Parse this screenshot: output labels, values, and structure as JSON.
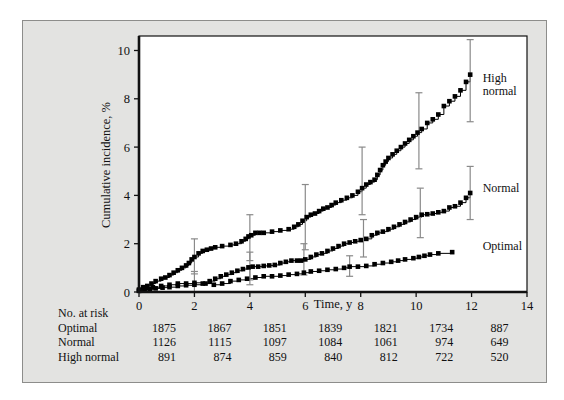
{
  "figure": {
    "background_color": "#e3e3e1",
    "plot_background_color": "#ffffff",
    "border_color": "#8d8d8b",
    "axis_color": "#111111",
    "marker_color": "#000000",
    "errorbar_color": "#8a8a8a"
  },
  "chart_data": {
    "type": "line",
    "title": "",
    "subtitle": "",
    "xlabel": "Time, y",
    "ylabel": "Cumulative incidence, %",
    "xlim": [
      0,
      14
    ],
    "ylim": [
      0,
      10.6
    ],
    "xticks": [
      0,
      2,
      4,
      6,
      8,
      10,
      12,
      14
    ],
    "xtick_labels": [
      "0",
      "2",
      "4",
      "6",
      "8",
      "10",
      "12",
      "14"
    ],
    "yticks": [
      0,
      2,
      4,
      6,
      8,
      10
    ],
    "ytick_labels": [
      "0",
      "2",
      "4",
      "6",
      "8",
      "10"
    ],
    "grid": false,
    "legend_position": "right-inline",
    "series": [
      {
        "name": "High normal",
        "label_lines": [
          "High",
          "normal"
        ],
        "label_x": 12.4,
        "label_y": 8.7,
        "marker": "square",
        "x": [
          0.0,
          0.15,
          0.3,
          0.45,
          0.6,
          0.8,
          0.95,
          1.1,
          1.25,
          1.4,
          1.55,
          1.7,
          1.8,
          1.9,
          2.0,
          2.15,
          2.3,
          2.45,
          2.6,
          2.75,
          3.0,
          3.3,
          3.5,
          3.7,
          3.85,
          3.95,
          4.05,
          4.2,
          4.35,
          4.5,
          4.8,
          5.1,
          5.4,
          5.6,
          5.75,
          5.9,
          6.05,
          6.2,
          6.35,
          6.5,
          6.65,
          6.8,
          6.95,
          7.1,
          7.3,
          7.5,
          7.7,
          7.9,
          8.05,
          8.2,
          8.35,
          8.5,
          8.6,
          8.7,
          8.8,
          8.9,
          9.0,
          9.15,
          9.3,
          9.45,
          9.6,
          9.75,
          9.9,
          10.05,
          10.2,
          10.4,
          10.6,
          10.8,
          11.0,
          11.2,
          11.4,
          11.6,
          11.8,
          11.95
        ],
        "y": [
          0.1,
          0.2,
          0.25,
          0.35,
          0.45,
          0.55,
          0.6,
          0.7,
          0.8,
          0.9,
          1.0,
          1.1,
          1.2,
          1.35,
          1.45,
          1.6,
          1.7,
          1.75,
          1.8,
          1.85,
          1.9,
          1.95,
          2.0,
          2.1,
          2.2,
          2.3,
          2.35,
          2.45,
          2.45,
          2.45,
          2.5,
          2.55,
          2.6,
          2.7,
          2.8,
          2.95,
          3.1,
          3.2,
          3.25,
          3.35,
          3.45,
          3.5,
          3.6,
          3.7,
          3.8,
          3.9,
          4.0,
          4.15,
          4.3,
          4.45,
          4.55,
          4.65,
          4.85,
          5.05,
          5.25,
          5.4,
          5.55,
          5.7,
          5.85,
          6.0,
          6.15,
          6.3,
          6.45,
          6.6,
          6.75,
          7.0,
          7.15,
          7.35,
          7.7,
          7.9,
          8.1,
          8.35,
          8.7,
          9.0
        ]
      },
      {
        "name": "Normal",
        "label_lines": [
          "Normal"
        ],
        "label_x": 12.4,
        "label_y": 4.15,
        "marker": "square",
        "x": [
          0.0,
          0.2,
          0.4,
          0.6,
          0.85,
          1.1,
          1.4,
          1.7,
          2.0,
          2.3,
          2.55,
          2.75,
          2.95,
          3.15,
          3.35,
          3.55,
          3.75,
          3.95,
          4.1,
          4.3,
          4.5,
          4.7,
          4.9,
          5.1,
          5.3,
          5.5,
          5.7,
          5.85,
          6.0,
          6.2,
          6.4,
          6.6,
          6.8,
          7.0,
          7.2,
          7.4,
          7.6,
          7.8,
          8.0,
          8.2,
          8.4,
          8.6,
          8.8,
          9.0,
          9.2,
          9.4,
          9.6,
          9.8,
          10.0,
          10.2,
          10.4,
          10.6,
          10.8,
          11.0,
          11.2,
          11.4,
          11.6,
          11.8,
          11.95
        ],
        "y": [
          0.05,
          0.1,
          0.12,
          0.15,
          0.18,
          0.2,
          0.25,
          0.28,
          0.3,
          0.35,
          0.45,
          0.55,
          0.65,
          0.72,
          0.8,
          0.88,
          0.95,
          1.02,
          1.05,
          1.05,
          1.08,
          1.1,
          1.12,
          1.2,
          1.25,
          1.3,
          1.3,
          1.3,
          1.35,
          1.45,
          1.55,
          1.6,
          1.7,
          1.8,
          1.9,
          2.0,
          2.05,
          2.1,
          2.15,
          2.2,
          2.35,
          2.45,
          2.5,
          2.6,
          2.7,
          2.8,
          2.9,
          3.0,
          3.1,
          3.2,
          3.22,
          3.25,
          3.3,
          3.35,
          3.5,
          3.55,
          3.7,
          3.9,
          4.1
        ]
      },
      {
        "name": "Optimal",
        "label_lines": [
          "Optimal"
        ],
        "label_x": 12.4,
        "label_y": 1.75,
        "marker": "square",
        "x": [
          0.0,
          0.25,
          0.5,
          0.8,
          1.1,
          1.4,
          1.7,
          2.0,
          2.4,
          2.7,
          3.0,
          3.3,
          3.6,
          3.9,
          4.2,
          4.5,
          4.8,
          5.1,
          5.4,
          5.7,
          5.95,
          6.2,
          6.5,
          6.8,
          7.1,
          7.4,
          7.6,
          7.9,
          8.2,
          8.5,
          8.8,
          9.1,
          9.35,
          9.6,
          9.9,
          10.1,
          10.3,
          10.5,
          10.8,
          11.3
        ],
        "y": [
          0.05,
          0.15,
          0.2,
          0.25,
          0.3,
          0.35,
          0.35,
          0.38,
          0.35,
          0.3,
          0.35,
          0.45,
          0.5,
          0.55,
          0.6,
          0.65,
          0.65,
          0.68,
          0.72,
          0.75,
          0.8,
          0.85,
          0.88,
          0.92,
          0.95,
          1.0,
          1.05,
          1.05,
          1.08,
          1.15,
          1.2,
          1.25,
          1.3,
          1.35,
          1.4,
          1.45,
          1.5,
          1.55,
          1.6,
          1.65
        ]
      }
    ],
    "errorbars": [
      {
        "series": "High normal",
        "x": 2.0,
        "y": 1.45,
        "lo": 0.75,
        "hi": 2.2
      },
      {
        "series": "High normal",
        "x": 4.0,
        "y": 2.3,
        "lo": 1.3,
        "hi": 3.2
      },
      {
        "series": "High normal",
        "x": 6.0,
        "y": 3.1,
        "lo": 1.75,
        "hi": 4.45
      },
      {
        "series": "High normal",
        "x": 8.05,
        "y": 4.45,
        "lo": 3.2,
        "hi": 6.0
      },
      {
        "series": "High normal",
        "x": 10.1,
        "y": 6.65,
        "lo": 5.1,
        "hi": 8.25
      },
      {
        "series": "High normal",
        "x": 11.95,
        "y": 9.0,
        "lo": 7.05,
        "hi": 10.45
      },
      {
        "series": "Normal",
        "x": 2.0,
        "y": 0.3,
        "lo": 0.0,
        "hi": 0.85
      },
      {
        "series": "Normal",
        "x": 4.0,
        "y": 1.05,
        "lo": 0.5,
        "hi": 1.65
      },
      {
        "series": "Normal",
        "x": 5.95,
        "y": 1.3,
        "lo": 0.7,
        "hi": 2.0
      },
      {
        "series": "Normal",
        "x": 8.1,
        "y": 2.2,
        "lo": 1.45,
        "hi": 3.0
      },
      {
        "series": "Normal",
        "x": 10.15,
        "y": 3.2,
        "lo": 2.25,
        "hi": 4.3
      },
      {
        "series": "Normal",
        "x": 11.95,
        "y": 4.1,
        "lo": 3.0,
        "hi": 5.2
      },
      {
        "series": "Optimal",
        "x": 4.0,
        "y": 0.62,
        "lo": 0.3,
        "hi": 1.0
      },
      {
        "series": "Optimal",
        "x": 7.6,
        "y": 1.05,
        "lo": 0.65,
        "hi": 1.5
      }
    ]
  },
  "risk_table": {
    "title": "No. at risk",
    "times": [
      0,
      2,
      4,
      6,
      8,
      10,
      12
    ],
    "rows": [
      {
        "label": "Optimal",
        "values": [
          "1875",
          "1867",
          "1851",
          "1839",
          "1821",
          "1734",
          "887"
        ]
      },
      {
        "label": "Normal",
        "values": [
          "1126",
          "1115",
          "1097",
          "1084",
          "1061",
          "974",
          "649"
        ]
      },
      {
        "label": "High normal",
        "values": [
          "891",
          "874",
          "859",
          "840",
          "812",
          "722",
          "520"
        ]
      }
    ]
  }
}
